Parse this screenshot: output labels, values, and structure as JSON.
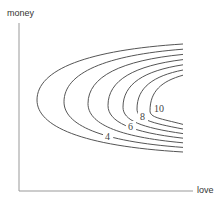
{
  "chart_data": {
    "type": "contour",
    "title": "",
    "xlabel": "love",
    "ylabel": "money",
    "grid": false,
    "legend": null,
    "levels": [
      4,
      5,
      6,
      7,
      8,
      9,
      10
    ],
    "labeled_levels": [
      4,
      6,
      8,
      10
    ],
    "colors": {
      "axis": "#999999",
      "curve": "#555555",
      "text": "#333333"
    }
  },
  "axes": {
    "x_label": "love",
    "y_label": "money"
  },
  "contours": [
    {
      "level": "4",
      "tip_x": 37,
      "label": "4",
      "label_x": 105,
      "label_y": 140
    },
    {
      "level": "5",
      "tip_x": 64,
      "label": ""
    },
    {
      "level": "6",
      "tip_x": 88,
      "label": "6",
      "label_x": 128,
      "label_y": 130
    },
    {
      "level": "7",
      "tip_x": 108,
      "label": ""
    },
    {
      "level": "8",
      "tip_x": 123,
      "label": "8",
      "label_x": 140,
      "label_y": 120
    },
    {
      "level": "9",
      "tip_x": 137,
      "label": ""
    },
    {
      "level": "10",
      "tip_x": 150,
      "label": "10",
      "label_x": 154,
      "label_y": 112
    }
  ]
}
